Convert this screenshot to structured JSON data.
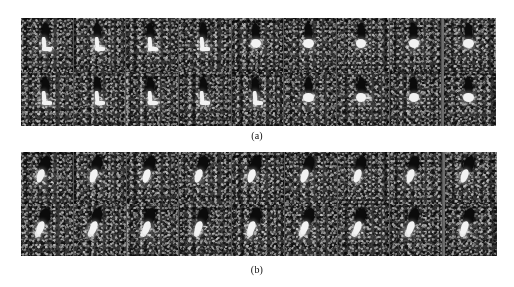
{
  "figure": {
    "background_color": "#ffffff",
    "panels": [
      {
        "id": "panel-a",
        "caption": "(a)",
        "rows": 2,
        "columns": 9,
        "separated_last_column": true,
        "tile_background_color": "#3a3a3a",
        "dark_feature_color": "#0b0b0b",
        "bright_feature_color": "#f2f2f2",
        "grid": [
          [
            {
              "frame": 1,
              "shape": "L-shape",
              "bright_form": "stem-and-foot"
            },
            {
              "frame": 2,
              "shape": "L-shape",
              "bright_form": "stem-and-foot"
            },
            {
              "frame": 3,
              "shape": "L-shape",
              "bright_form": "stem-and-foot"
            },
            {
              "frame": 4,
              "shape": "L-shape",
              "bright_form": "stem-and-foot"
            },
            {
              "frame": 5,
              "shape": "knot",
              "bright_form": "compact-knot"
            },
            {
              "frame": 6,
              "shape": "knot",
              "bright_form": "compact-knot"
            },
            {
              "frame": 7,
              "shape": "knot",
              "bright_form": "compact-knot"
            },
            {
              "frame": 8,
              "shape": "knot",
              "bright_form": "compact-knot"
            },
            {
              "frame": 9,
              "shape": "knot",
              "bright_form": "compact-knot"
            }
          ],
          [
            {
              "frame": 1,
              "shape": "L-shape",
              "bright_form": "stem-and-foot"
            },
            {
              "frame": 2,
              "shape": "L-shape",
              "bright_form": "stem-and-foot"
            },
            {
              "frame": 3,
              "shape": "L-shape",
              "bright_form": "stem-and-foot"
            },
            {
              "frame": 4,
              "shape": "L-shape",
              "bright_form": "stem-and-foot"
            },
            {
              "frame": 5,
              "shape": "L-shape",
              "bright_form": "stem-and-foot"
            },
            {
              "frame": 6,
              "shape": "knot",
              "bright_form": "compact-knot"
            },
            {
              "frame": 7,
              "shape": "knot",
              "bright_form": "knot-with-tail"
            },
            {
              "frame": 8,
              "shape": "knot",
              "bright_form": "compact-knot"
            },
            {
              "frame": 9,
              "shape": "knot",
              "bright_form": "compact-knot"
            }
          ]
        ]
      },
      {
        "id": "panel-b",
        "caption": "(b)",
        "rows": 2,
        "columns": 9,
        "separated_last_column": true,
        "tile_background_color": "#3a3a3a",
        "dark_feature_color": "#0b0b0b",
        "bright_feature_color": "#f2f2f2",
        "grid": [
          [
            {
              "frame": 1,
              "shape": "oblique-streak",
              "bright_form": "diagonal-streak"
            },
            {
              "frame": 2,
              "shape": "oblique-streak",
              "bright_form": "diagonal-streak"
            },
            {
              "frame": 3,
              "shape": "oblique-streak",
              "bright_form": "diagonal-streak"
            },
            {
              "frame": 4,
              "shape": "oblique-streak",
              "bright_form": "diagonal-streak"
            },
            {
              "frame": 5,
              "shape": "oblique-streak",
              "bright_form": "diagonal-streak"
            },
            {
              "frame": 6,
              "shape": "oblique-streak",
              "bright_form": "diagonal-streak"
            },
            {
              "frame": 7,
              "shape": "oblique-streak",
              "bright_form": "diagonal-streak"
            },
            {
              "frame": 8,
              "shape": "oblique-streak",
              "bright_form": "diagonal-streak"
            },
            {
              "frame": 9,
              "shape": "oblique-streak",
              "bright_form": "diagonal-streak"
            }
          ],
          [
            {
              "frame": 1,
              "shape": "oblique-streak",
              "bright_form": "diagonal-streak-long"
            },
            {
              "frame": 2,
              "shape": "oblique-streak",
              "bright_form": "diagonal-streak-long"
            },
            {
              "frame": 3,
              "shape": "oblique-streak",
              "bright_form": "diagonal-streak-long"
            },
            {
              "frame": 4,
              "shape": "oblique-streak",
              "bright_form": "diagonal-streak-long"
            },
            {
              "frame": 5,
              "shape": "oblique-streak",
              "bright_form": "diagonal-streak-long"
            },
            {
              "frame": 6,
              "shape": "oblique-streak",
              "bright_form": "diagonal-streak-long"
            },
            {
              "frame": 7,
              "shape": "oblique-streak",
              "bright_form": "diagonal-streak-long"
            },
            {
              "frame": 8,
              "shape": "oblique-streak",
              "bright_form": "diagonal-streak-long"
            },
            {
              "frame": 9,
              "shape": "oblique-streak",
              "bright_form": "diagonal-streak-long"
            }
          ]
        ]
      }
    ]
  }
}
